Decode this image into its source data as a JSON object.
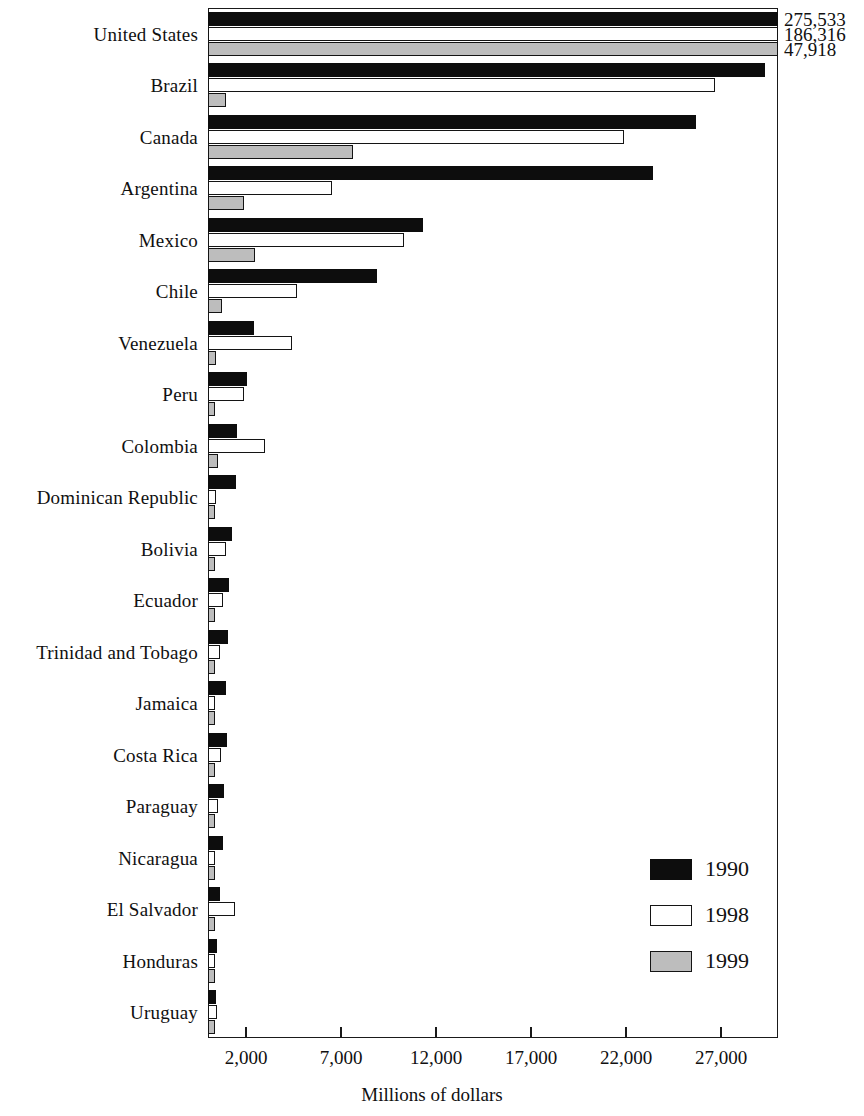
{
  "chart_data": {
    "type": "bar",
    "orientation": "horizontal",
    "title": "",
    "xlabel": "Millions of dollars",
    "ylabel": "",
    "xlim": [
      0,
      30000
    ],
    "xticks": [
      2000,
      7000,
      12000,
      17000,
      22000,
      27000
    ],
    "xtick_labels": [
      "2,000",
      "7,000",
      "12,000",
      "17,000",
      "22,000",
      "27,000"
    ],
    "grid": false,
    "legend_position": "bottom-right",
    "categories": [
      "United States",
      "Brazil",
      "Canada",
      "Argentina",
      "Mexico",
      "Chile",
      "Venezuela",
      "Peru",
      "Colombia",
      "Dominican Republic",
      "Bolivia",
      "Ecuador",
      "Trinidad and Tobago",
      "Jamaica",
      "Costa Rica",
      "Paraguay",
      "Nicaragua",
      "El Salvador",
      "Honduras",
      "Uruguay"
    ],
    "series": [
      {
        "name": "1990",
        "color": "#0d0d0d",
        "values": [
          275533,
          29300,
          25700,
          23400,
          11300,
          8900,
          2400,
          2050,
          1550,
          1450,
          1250,
          1100,
          1050,
          950,
          1000,
          850,
          800,
          650,
          450,
          400
        ]
      },
      {
        "name": "1998",
        "color": "#ffffff",
        "values": [
          186316,
          26700,
          21900,
          6500,
          10300,
          4700,
          4400,
          1900,
          3000,
          400,
          950,
          800,
          650,
          300,
          700,
          500,
          350,
          1400,
          300,
          450
        ]
      },
      {
        "name": "1999",
        "color": "#bdbdbd",
        "values": [
          47918,
          950,
          7650,
          1900,
          2450,
          750,
          400,
          250,
          500,
          200,
          250,
          250,
          200,
          200,
          200,
          200,
          150,
          150,
          200,
          250
        ]
      }
    ],
    "offscale_labels": [
      {
        "series": "1990",
        "category": "United States",
        "text": "275,533"
      },
      {
        "series": "1998",
        "category": "United States",
        "text": "186,316"
      },
      {
        "series": "1999",
        "category": "United States",
        "text": "47,918"
      }
    ],
    "note": "United States bars exceed the plotted axis range; their values are printed at the right edge."
  },
  "axis": {
    "title": "Millions of dollars",
    "ticks": [
      {
        "label": "2,000",
        "value": 2000
      },
      {
        "label": "7,000",
        "value": 7000
      },
      {
        "label": "12,000",
        "value": 12000
      },
      {
        "label": "17,000",
        "value": 17000
      },
      {
        "label": "22,000",
        "value": 22000
      },
      {
        "label": "27,000",
        "value": 27000
      }
    ]
  },
  "categories": [
    {
      "label": "United States"
    },
    {
      "label": "Brazil"
    },
    {
      "label": "Canada"
    },
    {
      "label": "Argentina"
    },
    {
      "label": "Mexico"
    },
    {
      "label": "Chile"
    },
    {
      "label": "Venezuela"
    },
    {
      "label": "Peru"
    },
    {
      "label": "Colombia"
    },
    {
      "label": "Dominican Republic"
    },
    {
      "label": "Bolivia"
    },
    {
      "label": "Ecuador"
    },
    {
      "label": "Trinidad and Tobago"
    },
    {
      "label": "Jamaica"
    },
    {
      "label": "Costa Rica"
    },
    {
      "label": "Paraguay"
    },
    {
      "label": "Nicaragua"
    },
    {
      "label": "El Salvador"
    },
    {
      "label": "Honduras"
    },
    {
      "label": "Uruguay"
    }
  ],
  "callouts": [
    {
      "text": "275,533"
    },
    {
      "text": "186,316"
    },
    {
      "text": "47,918"
    }
  ],
  "legend": {
    "items": [
      {
        "label": "1990",
        "color": "#0d0d0d"
      },
      {
        "label": "1998",
        "color": "#ffffff"
      },
      {
        "label": "1999",
        "color": "#bdbdbd"
      }
    ]
  }
}
